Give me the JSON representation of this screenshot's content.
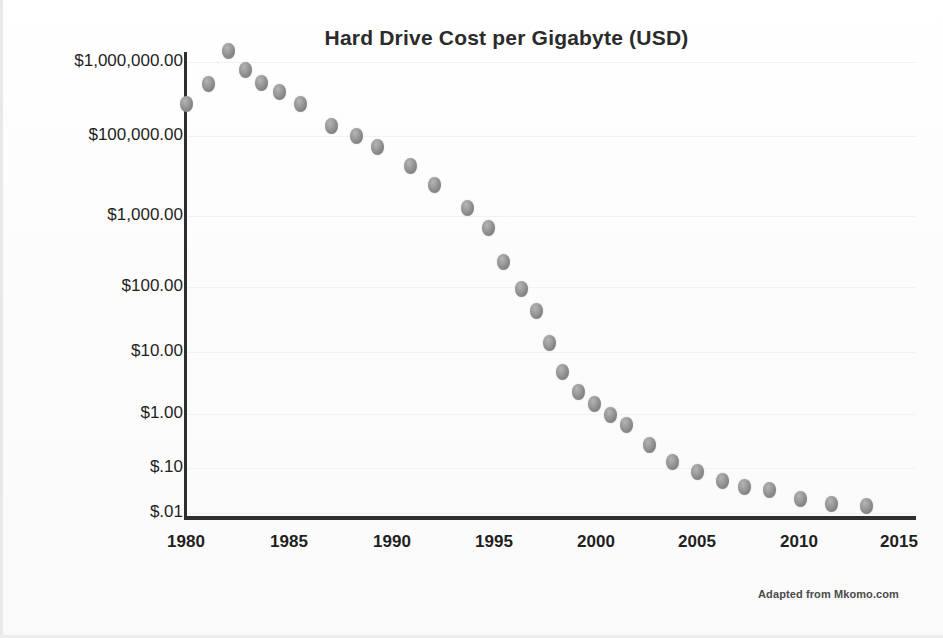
{
  "chart_data": {
    "type": "scatter",
    "title": "Hard Drive Cost per Gigabyte (USD)",
    "xlabel": "",
    "ylabel": "",
    "yscale": "log",
    "grid": true,
    "legend": null,
    "xlim": [
      1980,
      2015
    ],
    "ylim": [
      0.01,
      1000000
    ],
    "x_tick_labels": [
      "1980",
      "1985",
      "1990",
      "1995",
      "2000",
      "2005",
      "2010",
      "2015"
    ],
    "x_ticks": [
      1980,
      1985,
      1990,
      1995,
      2000,
      2005,
      2010,
      2015
    ],
    "y_tick_labels": [
      "$1,000,000.00",
      "$100,000.00",
      "$1,000.00",
      "$100.00",
      "$10.00",
      "$1.00",
      "$.10",
      "$.01"
    ],
    "y_ticks": [
      1000000,
      100000,
      1000,
      100,
      10,
      1,
      0.1,
      0.01
    ],
    "annotation": "Adapted from Mkomo.com",
    "marker_color": "#8d8d8d",
    "axis_color": "#2e2e2e",
    "text_color": "#1f1f1f",
    "x": [
      1980,
      1981,
      1982,
      1983,
      1984,
      1985,
      1987,
      1988,
      1989,
      1990,
      1991,
      1993,
      1994,
      1995,
      1996,
      1997,
      1998,
      1999,
      2000,
      2001,
      2002,
      2003,
      2004,
      2005,
      2006,
      2007,
      2008,
      2009,
      2011,
      2012,
      2013,
      2014
    ],
    "y": [
      300000,
      500000,
      1500000,
      700000,
      400000,
      250000,
      150000,
      110000,
      70000,
      30000,
      8000,
      2000,
      600,
      200,
      90,
      38,
      14,
      4.8,
      2.2,
      1.5,
      0.95,
      0.6,
      0.28,
      0.13,
      0.075,
      0.045,
      0.04,
      0.032,
      0.022,
      0.018,
      0.016,
      0.015
    ],
    "points": [
      {
        "year": 1980,
        "cost": 300000,
        "px": 186,
        "py": 104
      },
      {
        "year": 1981,
        "cost": 500000,
        "px": 208,
        "py": 84
      },
      {
        "year": 1982,
        "cost": 1500000,
        "px": 228,
        "py": 51
      },
      {
        "year": 1983,
        "cost": 700000,
        "px": 245,
        "py": 70
      },
      {
        "year": 1984,
        "cost": 400000,
        "px": 261,
        "py": 83
      },
      {
        "year": 1985,
        "cost": 250000,
        "px": 279,
        "py": 92
      },
      {
        "year": 1986,
        "cost": 180000,
        "px": 300,
        "py": 104
      },
      {
        "year": 1987,
        "cost": 150000,
        "px": 331,
        "py": 126
      },
      {
        "year": 1988,
        "cost": 110000,
        "px": 356,
        "py": 136
      },
      {
        "year": 1989,
        "cost": 70000,
        "px": 377,
        "py": 147
      },
      {
        "year": 1990,
        "cost": 30000,
        "px": 410,
        "py": 166
      },
      {
        "year": 1991,
        "cost": 13000,
        "px": 434,
        "py": 185
      },
      {
        "year": 1993,
        "cost": 2000,
        "px": 467,
        "py": 208
      },
      {
        "year": 1994,
        "cost": 700,
        "px": 488,
        "py": 228
      },
      {
        "year": 1995,
        "cost": 200,
        "px": 503,
        "py": 262
      },
      {
        "year": 1996,
        "cost": 90,
        "px": 521,
        "py": 289
      },
      {
        "year": 1997,
        "cost": 38,
        "px": 536,
        "py": 311
      },
      {
        "year": 1997.8,
        "cost": 14,
        "px": 549,
        "py": 343
      },
      {
        "year": 1998.5,
        "cost": 4.8,
        "px": 562,
        "py": 372
      },
      {
        "year": 1999,
        "cost": 2.2,
        "px": 578,
        "py": 392
      },
      {
        "year": 2000,
        "cost": 1.5,
        "px": 594,
        "py": 404
      },
      {
        "year": 2001,
        "cost": 0.95,
        "px": 610,
        "py": 415
      },
      {
        "year": 2002,
        "cost": 0.6,
        "px": 626,
        "py": 425
      },
      {
        "year": 2003,
        "cost": 0.28,
        "px": 649,
        "py": 445
      },
      {
        "year": 2004,
        "cost": 0.13,
        "px": 672,
        "py": 462
      },
      {
        "year": 2006,
        "cost": 0.075,
        "px": 697,
        "py": 472
      },
      {
        "year": 2007,
        "cost": 0.05,
        "px": 722,
        "py": 481
      },
      {
        "year": 2008,
        "cost": 0.042,
        "px": 744,
        "py": 487
      },
      {
        "year": 2009,
        "cost": 0.035,
        "px": 769,
        "py": 490
      },
      {
        "year": 2011,
        "cost": 0.024,
        "px": 800,
        "py": 499
      },
      {
        "year": 2012,
        "cost": 0.019,
        "px": 831,
        "py": 504
      },
      {
        "year": 2014,
        "cost": 0.016,
        "px": 866,
        "py": 506
      }
    ],
    "y_tick_positions": [
      {
        "label": "$1,000,000.00",
        "value": 1000000,
        "py": 62
      },
      {
        "label": "$100,000.00",
        "value": 100000,
        "py": 136
      },
      {
        "label": "$1,000.00",
        "value": 1000,
        "py": 216
      },
      {
        "label": "$100.00",
        "value": 100,
        "py": 287
      },
      {
        "label": "$10.00",
        "value": 10,
        "py": 352
      },
      {
        "label": "$1.00",
        "value": 1,
        "py": 414
      },
      {
        "label": "$.10",
        "value": 0.1,
        "py": 468
      },
      {
        "label": "$.01",
        "value": 0.01,
        "py": 513
      }
    ],
    "x_tick_positions": [
      {
        "label": "1980",
        "value": 1980,
        "px": 186
      },
      {
        "label": "1985",
        "value": 1985,
        "px": 289
      },
      {
        "label": "1990",
        "value": 1990,
        "px": 392
      },
      {
        "label": "1995",
        "value": 1995,
        "px": 494
      },
      {
        "label": "2000",
        "value": 2000,
        "px": 596
      },
      {
        "label": "2005",
        "value": 2005,
        "px": 697
      },
      {
        "label": "2010",
        "value": 2010,
        "px": 799
      },
      {
        "label": "2015",
        "value": 2015,
        "px": 899
      }
    ]
  }
}
